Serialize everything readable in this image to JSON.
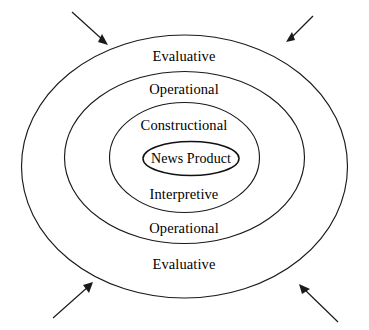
{
  "diagram": {
    "type": "concentric-ellipses",
    "background_color": "#ffffff",
    "stroke_color": "#1a1a1a",
    "layers": [
      {
        "index": 0,
        "name": "evaluative",
        "label_top": "Evaluative",
        "label_bottom": "Evaluative"
      },
      {
        "index": 1,
        "name": "operational",
        "label_top": "Operational",
        "label_bottom": "Operational"
      },
      {
        "index": 2,
        "name": "constructional",
        "label_top": "Constructional",
        "label_bottom": "Interpretive"
      },
      {
        "index": 3,
        "name": "core",
        "label_top": "News Product",
        "label_bottom": ""
      }
    ],
    "labels": {
      "evaluative_top": "Evaluative",
      "operational_top": "Operational",
      "constructional": "Constructional",
      "news_product": "News Product",
      "interpretive": "Interpretive",
      "operational_bottom": "Operational",
      "evaluative_bottom": "Evaluative"
    },
    "arrows": [
      {
        "name": "arrow-top-left",
        "direction": "down-right",
        "from": [
          72,
          12
        ],
        "to": [
          107,
          44
        ]
      },
      {
        "name": "arrow-top-right",
        "direction": "down-left",
        "from": [
          313,
          16
        ],
        "to": [
          288,
          40
        ]
      },
      {
        "name": "arrow-bottom-left",
        "direction": "up-right",
        "from": [
          53,
          318
        ],
        "to": [
          92,
          283
        ]
      },
      {
        "name": "arrow-bottom-right",
        "direction": "up-left",
        "from": [
          338,
          322
        ],
        "to": [
          300,
          285
        ]
      }
    ]
  }
}
